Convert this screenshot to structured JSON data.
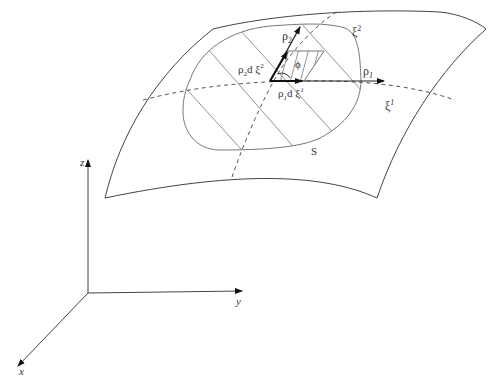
{
  "figure": {
    "type": "diagram",
    "axes": {
      "z_label": "z",
      "y_label": "y",
      "x_label": "x"
    },
    "surface_labels": {
      "region": "S",
      "coord1": "ξ",
      "coord1_sup": "1",
      "coord2": "ξ",
      "coord2_sup": "2"
    },
    "vectors": {
      "rho1": "ρ",
      "rho1_sub": "1",
      "rho2": "ρ",
      "rho2_sub": "2",
      "elem1": "ρ",
      "elem1_sub": "1",
      "elem1_rest": "d ξ",
      "elem1_sup": "1",
      "elem2": "ρ",
      "elem2_sub": "2",
      "elem2_rest": "d ξ",
      "elem2_sup": "2",
      "angle": "ϕ"
    },
    "colors": {
      "surface_stroke": "#444444",
      "region_stroke": "#777777",
      "hatch_stroke": "#888888",
      "vector_stroke": "#111111",
      "background": "#ffffff"
    }
  }
}
